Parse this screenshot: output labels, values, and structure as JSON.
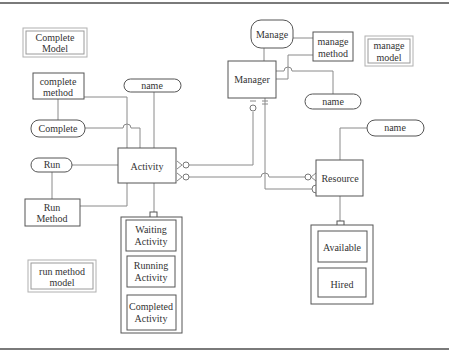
{
  "diagram": {
    "models": {
      "complete_model": [
        "Complete",
        "Model"
      ],
      "manage_model": [
        "manage",
        "model"
      ],
      "run_method_model": [
        "run method",
        "model"
      ]
    },
    "entities": {
      "activity": "Activity",
      "manager": "Manager",
      "resource": "Resource"
    },
    "methods": {
      "complete_method": [
        "complete",
        "method"
      ],
      "run_method": [
        "Run",
        "Method"
      ],
      "manage_method": [
        "manage",
        "method"
      ]
    },
    "events": {
      "complete": "Complete",
      "run": "Run",
      "manage": "Manage"
    },
    "attributes": {
      "activity_name": "name",
      "manager_name": "name",
      "resource_name": "name"
    },
    "activity_states": [
      [
        "Waiting",
        "Activity"
      ],
      [
        "Running",
        "Activity"
      ],
      [
        "Completed",
        "Activity"
      ]
    ],
    "resource_states": [
      "Available",
      "Hired"
    ],
    "colors": {
      "line": "#8a8a8a",
      "border": "#555555",
      "frame": "#7a7a7a"
    }
  }
}
